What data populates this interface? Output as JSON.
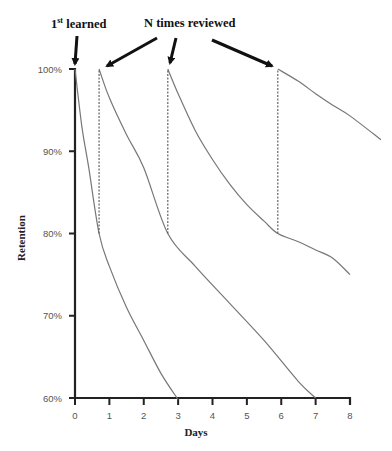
{
  "annotations": {
    "first_learned": {
      "prefix": "1",
      "sup": "st",
      "suffix": " learned"
    },
    "reviewed": "N times reviewed"
  },
  "axes": {
    "xlabel": "Days",
    "ylabel": "Retention",
    "x_ticks": [
      "0",
      "1",
      "2",
      "3",
      "4",
      "5",
      "6",
      "7",
      "8"
    ],
    "y_ticks": [
      "60%",
      "70%",
      "80%",
      "90%",
      "100%"
    ]
  },
  "colors": {
    "axis": "#222222",
    "curve": "#777777",
    "dashed": "#555555",
    "arrow": "#111111"
  },
  "chart_data": {
    "type": "line",
    "title": "",
    "xlabel": "Days",
    "ylabel": "Retention",
    "xlim": [
      0,
      8
    ],
    "ylim": [
      60,
      100
    ],
    "grid": false,
    "legend": null,
    "annotations": [
      {
        "text": "1st learned",
        "points_to": {
          "x": 0,
          "y": 100
        }
      },
      {
        "text": "N times reviewed",
        "points_to": [
          {
            "x": 0.7,
            "y": 100
          },
          {
            "x": 2.7,
            "y": 100
          },
          {
            "x": 5.9,
            "y": 100
          }
        ]
      }
    ],
    "series": [
      {
        "name": "Initial learning",
        "x": [
          0,
          0.2,
          0.4,
          0.7,
          1.0,
          1.5,
          2.0,
          2.5,
          3.0
        ],
        "y": [
          100,
          93,
          88,
          80,
          76,
          71,
          67,
          63,
          59.8
        ]
      },
      {
        "name": "Review 1",
        "x": [
          0.7,
          1.0,
          1.5,
          2.0,
          2.7,
          3.5,
          4.5,
          5.5,
          6.5,
          7.0
        ],
        "y": [
          100,
          96.5,
          92,
          88,
          80,
          76,
          71.5,
          67,
          62,
          60
        ]
      },
      {
        "name": "Review 2",
        "x": [
          2.7,
          3.0,
          3.5,
          4.0,
          4.5,
          5.0,
          5.5,
          5.9,
          6.5,
          7.0,
          7.5,
          8.0
        ],
        "y": [
          100,
          97,
          92.5,
          89,
          86,
          83.5,
          81.5,
          80,
          79,
          78,
          77,
          75
        ]
      },
      {
        "name": "Review 3",
        "x": [
          5.9,
          6.5,
          7.0,
          7.5,
          8.0,
          8.9
        ],
        "y": [
          100,
          98.5,
          97,
          95.6,
          94.3,
          91.4
        ]
      }
    ],
    "review_markers": [
      {
        "x": 0.7,
        "from": 80,
        "to": 100,
        "style": "dashed"
      },
      {
        "x": 2.7,
        "from": 80,
        "to": 100,
        "style": "dashed"
      },
      {
        "x": 5.9,
        "from": 80,
        "to": 100,
        "style": "dashed"
      }
    ]
  }
}
